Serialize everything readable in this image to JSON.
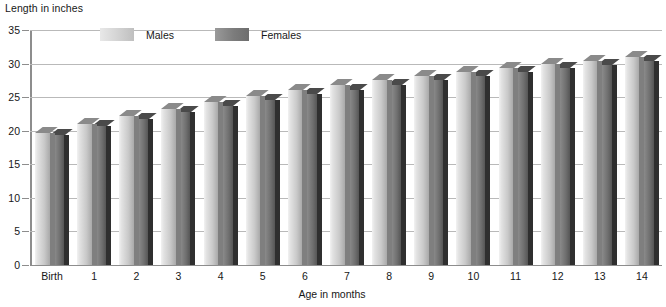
{
  "chart_data": {
    "type": "bar",
    "title": "",
    "ylabel": "Length in inches",
    "xlabel": "Age in months",
    "categories": [
      "Birth",
      "1",
      "2",
      "3",
      "4",
      "5",
      "6",
      "7",
      "8",
      "9",
      "10",
      "11",
      "12",
      "13",
      "14"
    ],
    "series": [
      {
        "name": "Males",
        "color": "#d2d2d2",
        "values": [
          19.7,
          21.0,
          22.2,
          23.3,
          24.3,
          25.2,
          26.0,
          26.8,
          27.5,
          28.2,
          28.8,
          29.4,
          29.9,
          30.4,
          31.0
        ]
      },
      {
        "name": "Females",
        "color": "#7c7c7c",
        "values": [
          19.4,
          20.7,
          21.8,
          22.8,
          23.7,
          24.6,
          25.4,
          26.1,
          26.8,
          27.5,
          28.1,
          28.7,
          29.3,
          29.8,
          30.4
        ]
      }
    ],
    "ylim": [
      0,
      35
    ],
    "yticks": [
      0,
      5,
      10,
      15,
      20,
      25,
      30,
      35
    ],
    "grid": true,
    "legend_position": "top-inside"
  },
  "axes": {
    "y_axis_title": "Length in inches",
    "x_axis_title": "Age in months"
  },
  "legend": {
    "items": [
      {
        "label": "Males"
      },
      {
        "label": "Females"
      }
    ]
  }
}
